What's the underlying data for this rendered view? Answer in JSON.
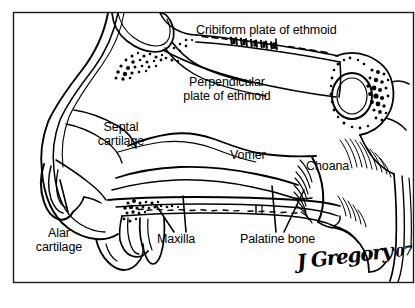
{
  "figure": {
    "kind": "anatomical-illustration",
    "style": "black-and-white line art with stippling",
    "background_color": "#ffffff",
    "ink_color": "#000000",
    "border": {
      "present": true,
      "color": "#1a1a1a",
      "thickness_px": 1
    },
    "labels": [
      {
        "id": "cribiform-plate-of-ethmoid",
        "text": "Cribiform plate of ethmoid",
        "lines": [
          "Cribiform plate of ethmoid"
        ],
        "leader": "single-vertical-down"
      },
      {
        "id": "perpendicular-plate-of-ethmoid",
        "text": "Perpendicular plate of ethmoid",
        "lines": [
          "Perpendicular",
          "plate of ethmoid"
        ],
        "leader": "none"
      },
      {
        "id": "septal-cartilage",
        "text": "Septal cartilage",
        "lines": [
          "Septal",
          "cartilage"
        ],
        "leader": "none"
      },
      {
        "id": "vomer",
        "text": "Vomer",
        "lines": [
          "Vomer"
        ],
        "leader": "none"
      },
      {
        "id": "choana",
        "text": "Choana",
        "lines": [
          "Choana"
        ],
        "leader": "none"
      },
      {
        "id": "alar-cartilage",
        "text": "Alar cartilage",
        "lines": [
          "Alar",
          "cartilage"
        ],
        "leader": "single-vertical-up"
      },
      {
        "id": "maxilla",
        "text": "Maxilla",
        "lines": [
          "Maxilla"
        ],
        "leader": "double-v-up"
      },
      {
        "id": "palatine-bone",
        "text": "Palatine bone",
        "lines": [
          "Palatine bone"
        ],
        "leader": "double-v-up"
      }
    ],
    "label_text": {
      "cribiform_plate": "Cribiform plate of ethmoid",
      "perpendicular_line1": "Perpendicular",
      "perpendicular_line2": "plate of ethmoid",
      "septal_line1": "Septal",
      "septal_line2": "cartilage",
      "vomer": "Vomer",
      "choana": "Choana",
      "alar_line1": "Alar",
      "alar_line2": "cartilage",
      "maxilla": "Maxilla",
      "palatine_bone": "Palatine bone"
    },
    "signature": {
      "artist": "J Gregory",
      "year": "'07",
      "full": "J Gregory '07"
    }
  }
}
